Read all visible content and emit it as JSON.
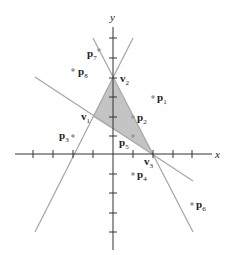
{
  "diagram": {
    "axes": {
      "x_label": "x",
      "y_label": "y"
    },
    "colors": {
      "region_fill": "#c4c4c4",
      "line": "#a8a8a8",
      "axis": "#333333",
      "point": "#999999",
      "text": "#222222"
    },
    "vertices": [
      {
        "name": "v",
        "sub": "1",
        "coord": [
          -1,
          2
        ]
      },
      {
        "name": "v",
        "sub": "2",
        "coord": [
          0,
          4
        ]
      },
      {
        "name": "v",
        "sub": "3",
        "coord": [
          2,
          0
        ]
      }
    ],
    "points": [
      {
        "name": "p",
        "sub": "1",
        "coord": [
          2,
          3
        ]
      },
      {
        "name": "p",
        "sub": "2",
        "coord": [
          1,
          2
        ]
      },
      {
        "name": "p",
        "sub": "3",
        "coord": [
          -2,
          1
        ]
      },
      {
        "name": "p",
        "sub": "4",
        "coord": [
          1,
          -1
        ]
      },
      {
        "name": "p",
        "sub": "5",
        "coord": [
          1,
          1
        ]
      },
      {
        "name": "p",
        "sub": "6",
        "coord": [
          4,
          -2.5
        ]
      },
      {
        "name": "p",
        "sub": "7",
        "coord": [
          -1,
          6
        ]
      },
      {
        "name": "p",
        "sub": "8",
        "coord": [
          -2,
          4
        ]
      }
    ]
  }
}
